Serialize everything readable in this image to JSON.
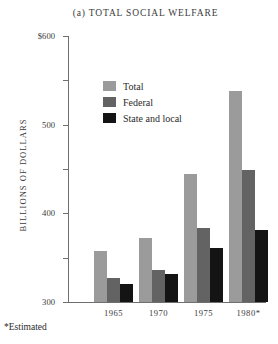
{
  "chart_data": {
    "type": "bar",
    "title": "(a) TOTAL SOCIAL WELFARE",
    "xlabel": "",
    "ylabel": "BILLIONS OF DOLLARS",
    "categories": [
      "1965",
      "1970",
      "1975",
      "1980*"
    ],
    "series": [
      {
        "name": "Total",
        "color": "#9b9b9b",
        "values": [
          115,
          144,
          288,
          477
        ]
      },
      {
        "name": "Federal",
        "color": "#636363",
        "values": [
          54,
          73,
          167,
          297
        ]
      },
      {
        "name": "State and local",
        "color": "#141414",
        "values": [
          41,
          64,
          121,
          162
        ]
      }
    ],
    "ylim": [
      0,
      600
    ],
    "yticks": [
      0,
      100,
      200,
      300,
      400,
      500,
      600
    ],
    "ytick_labels": [
      "0",
      "100",
      "200",
      "300",
      "400",
      "500",
      "$600"
    ],
    "grid": false,
    "legend_position": "upper-center-left",
    "footnote": "*Estimated"
  }
}
